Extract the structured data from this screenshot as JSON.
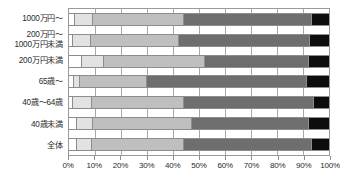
{
  "chart_data": {
    "type": "bar",
    "orientation": "horizontal",
    "stacked": "100%",
    "title": "",
    "xlabel": "",
    "ylabel": "",
    "xlim": [
      0,
      100
    ],
    "xticks": [
      0,
      10,
      20,
      30,
      40,
      50,
      60,
      70,
      80,
      90,
      100
    ],
    "xtick_labels": [
      "0%",
      "10%",
      "20%",
      "30%",
      "40%",
      "50%",
      "60%",
      "70%",
      "80%",
      "90%",
      "100%"
    ],
    "grid": true,
    "legend": "none",
    "categories": [
      "1000万円～",
      "200万円～\n1000万円未満",
      "200万円未満",
      "65歳～",
      "40歳～64歳",
      "40歳未満",
      "全体"
    ],
    "series": [
      {
        "name": "segment-1",
        "color": "#ffffff",
        "values": [
          2.0,
          1.0,
          4.5,
          1.5,
          1.0,
          2.5,
          2.5
        ]
      },
      {
        "name": "segment-2",
        "color": "#e2e2e2",
        "values": [
          7.0,
          7.0,
          8.5,
          2.5,
          7.5,
          6.5,
          6.0
        ]
      },
      {
        "name": "segment-3",
        "color": "#bfbfbf",
        "values": [
          35.0,
          34.0,
          39.0,
          25.5,
          35.5,
          38.0,
          35.5
        ]
      },
      {
        "name": "segment-4",
        "color": "#6e6e6e",
        "values": [
          49.0,
          50.5,
          40.0,
          61.5,
          50.0,
          45.0,
          49.0
        ]
      },
      {
        "name": "segment-5",
        "color": "#0d0d0d",
        "values": [
          7.0,
          7.5,
          8.0,
          9.0,
          6.0,
          8.0,
          7.0
        ]
      }
    ]
  },
  "colors": {
    "axis": "#9a9a9a",
    "grid": "#a8a8a8",
    "text": "#2b2b2b",
    "background": "#ffffff"
  }
}
